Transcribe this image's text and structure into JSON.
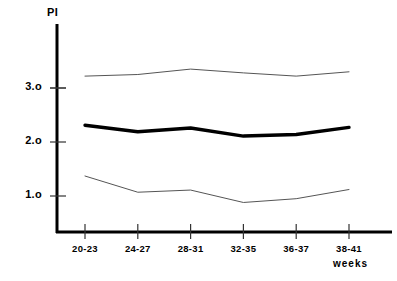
{
  "chart_data": {
    "type": "line",
    "title": "",
    "subtitle": "",
    "xlabel": "weeks",
    "ylabel": "PI",
    "categories": [
      "20-23",
      "24-27",
      "28-31",
      "32-35",
      "36-37",
      "38-41"
    ],
    "x_tick_labels": [
      "20-23",
      "24-27",
      "28-31",
      "32-35",
      "36-37",
      "38-41"
    ],
    "y_tick_labels": [
      "3.o",
      "2.o",
      "1.o"
    ],
    "y_tick_values": [
      3.0,
      2.0,
      1.0
    ],
    "ylim": [
      0.0,
      3.75
    ],
    "xlim": [
      0,
      7
    ],
    "grid": false,
    "legend": null,
    "legend_position": "none",
    "series": [
      {
        "name": "upper-percentile",
        "style": "thin",
        "color": "#555555",
        "values": [
          3.22,
          3.25,
          3.35,
          3.28,
          3.22,
          3.3
        ]
      },
      {
        "name": "mean",
        "style": "bold",
        "color": "#000000",
        "values": [
          2.31,
          2.19,
          2.26,
          2.11,
          2.14,
          2.27
        ]
      },
      {
        "name": "lower-percentile",
        "style": "thin",
        "color": "#555555",
        "values": [
          1.37,
          1.07,
          1.11,
          0.88,
          0.95,
          1.12
        ]
      }
    ]
  },
  "figure": {
    "y_axis_title": "PI",
    "x_axis_title": "weeks",
    "axis_color": "#000000",
    "background": "#ffffff"
  }
}
